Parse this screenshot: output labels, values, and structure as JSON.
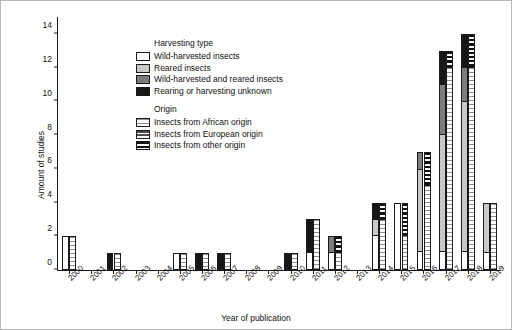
{
  "chart_data": {
    "type": "bar",
    "title": "",
    "xlabel": "Year of publication",
    "ylabel": "Amount of studies",
    "ylim": [
      0,
      15
    ],
    "yticks": [
      0,
      2,
      4,
      6,
      8,
      10,
      12,
      14
    ],
    "grid": false,
    "legend_position": "upper-left inside axes",
    "categories": [
      "2000",
      "2001",
      "2002",
      "2003",
      "2004",
      "2005",
      "2006",
      "2007",
      "2008",
      "2009",
      "2010",
      "2011",
      "2012",
      "2013",
      "2014",
      "2015",
      "2016",
      "2017",
      "2018",
      "2019"
    ],
    "legend_groups": [
      {
        "title": "Harvesting type",
        "entries": [
          {
            "label": "Wild-harvested insects",
            "key": "white",
            "color": "#ffffff"
          },
          {
            "label": "Reared insects",
            "key": "light-gray",
            "color": "#c9c9c9"
          },
          {
            "label": "Wild-harvested and reared insects",
            "key": "dark-gray",
            "color": "#7d7d7d"
          },
          {
            "label": "Rearing or harvesting unknown",
            "key": "black",
            "color": "#171717"
          }
        ]
      },
      {
        "title": "Origin",
        "entries": [
          {
            "label": "Insects from African origin",
            "key": "african-hatch",
            "color": "#8e8e8e"
          },
          {
            "label": "Insects from European origin",
            "key": "european-hatch",
            "color": "#4a4a4a"
          },
          {
            "label": "Insects from other origin",
            "key": "other-hatch",
            "color": "#111111"
          }
        ]
      }
    ],
    "series": [
      {
        "name": "Wild-harvested insects",
        "stack": "harvesting-type",
        "values": [
          2,
          0,
          0,
          0,
          0,
          1,
          0,
          0,
          0,
          0,
          0,
          1,
          1,
          0,
          2,
          4,
          1,
          1,
          1,
          1
        ]
      },
      {
        "name": "Reared insects",
        "stack": "harvesting-type",
        "values": [
          0,
          0,
          0,
          0,
          0,
          0,
          0,
          0,
          0,
          0,
          0,
          0,
          0,
          0,
          1,
          0,
          5,
          7,
          9,
          3
        ]
      },
      {
        "name": "Wild-harvested and reared insects",
        "stack": "harvesting-type",
        "values": [
          0,
          0,
          0,
          0,
          0,
          0,
          0,
          0,
          0,
          0,
          0,
          0,
          1,
          0,
          0,
          0,
          1,
          3,
          2,
          0
        ]
      },
      {
        "name": "Rearing or harvesting unknown",
        "stack": "harvesting-type",
        "values": [
          0,
          0,
          1,
          0,
          0,
          0,
          1,
          1,
          0,
          0,
          1,
          2,
          0,
          0,
          1,
          0,
          0,
          2,
          2,
          0
        ]
      },
      {
        "name": "Insects from African origin",
        "stack": "origin",
        "values": [
          2,
          0,
          1,
          0,
          0,
          1,
          1,
          1,
          0,
          0,
          1,
          3,
          1,
          0,
          3,
          2,
          5,
          12,
          12,
          4
        ]
      },
      {
        "name": "Insects from European origin",
        "stack": "origin",
        "values": [
          0,
          0,
          0,
          0,
          0,
          0,
          0,
          0,
          0,
          0,
          0,
          0,
          0,
          0,
          0,
          0,
          0,
          0,
          0,
          0
        ]
      },
      {
        "name": "Insects from other origin",
        "stack": "origin",
        "values": [
          0,
          0,
          0,
          0,
          0,
          0,
          0,
          0,
          0,
          0,
          0,
          0,
          1,
          0,
          1,
          2,
          2,
          1,
          2,
          0
        ]
      }
    ],
    "totals_by_year": {
      "harvesting-type": [
        2,
        0,
        1,
        0,
        0,
        1,
        1,
        1,
        0,
        0,
        1,
        3,
        2,
        0,
        4,
        4,
        7,
        13,
        14,
        4
      ],
      "origin": [
        2,
        0,
        1,
        0,
        0,
        1,
        1,
        1,
        0,
        0,
        1,
        3,
        2,
        0,
        4,
        4,
        7,
        13,
        14,
        4
      ]
    }
  }
}
